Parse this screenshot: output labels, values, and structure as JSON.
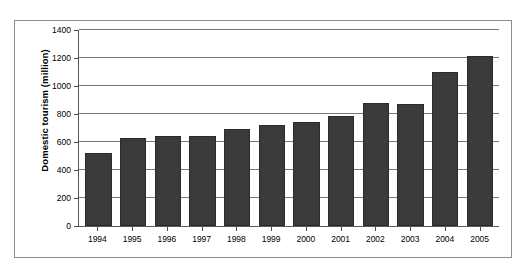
{
  "chart_data": {
    "type": "bar",
    "title": "",
    "xlabel": "",
    "ylabel": "Domestic tourism (million)",
    "categories": [
      "1994",
      "1995",
      "1996",
      "1997",
      "1998",
      "1999",
      "2000",
      "2001",
      "2002",
      "2003",
      "2004",
      "2005"
    ],
    "values": [
      524,
      629,
      640,
      644,
      695,
      719,
      744,
      784,
      878,
      870,
      1102,
      1212
    ],
    "ylim": [
      0,
      1400
    ],
    "ytick_labels": [
      "0",
      "200",
      "400",
      "600",
      "800",
      "1000",
      "1200",
      "1400"
    ],
    "ytick_values": [
      0,
      200,
      400,
      600,
      800,
      1000,
      1200,
      1400
    ],
    "grid": true,
    "legend": "none",
    "bar_color": "#3a3a3a",
    "gridline_color": "#777777",
    "axis_color": "#5a5a5a",
    "frame_color": "#8d8d8d",
    "background_color": "#ffffff"
  }
}
